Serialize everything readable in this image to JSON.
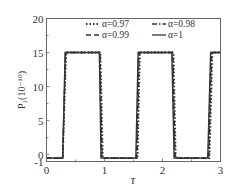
{
  "chart_data": {
    "type": "line",
    "title": "",
    "xlabel": "τ",
    "ylabel": "P₁(10⁻¹⁰)",
    "xlim": [
      0,
      3
    ],
    "ylim": [
      -1,
      20
    ],
    "xticks": [
      0,
      1,
      2,
      3
    ],
    "xtick_labels": [
      "0",
      "1",
      "2",
      "3"
    ],
    "yticks": [
      -1,
      0,
      5,
      10,
      15,
      20
    ],
    "ytick_labels": [
      "-1",
      "0",
      "5",
      "10",
      "15",
      "20"
    ],
    "grid": false,
    "legend_position": "upper center, inside",
    "legend": [
      {
        "label": "α=0.97",
        "style": "dotted"
      },
      {
        "label": "α=0.98",
        "style": "dashdot"
      },
      {
        "label": "α=0.99",
        "style": "dashed"
      },
      {
        "label": "α=1",
        "style": "solid"
      }
    ],
    "series": [
      {
        "name": "α=0.97",
        "style": "dotted",
        "x": [
          0,
          0.28,
          0.34,
          0.93,
          0.97,
          1.57,
          1.61,
          2.19,
          2.23,
          2.81,
          2.86,
          3.0
        ],
        "y": [
          -0.5,
          -0.5,
          15,
          15,
          -0.5,
          -0.5,
          15,
          15,
          -0.5,
          -0.5,
          15,
          15
        ]
      },
      {
        "name": "α=0.98",
        "style": "dashdot",
        "x": [
          0,
          0.28,
          0.33,
          0.92,
          0.96,
          1.56,
          1.6,
          2.18,
          2.22,
          2.8,
          2.85,
          3.0
        ],
        "y": [
          -0.5,
          -0.5,
          15,
          15,
          -0.5,
          -0.5,
          15,
          15,
          -0.5,
          -0.5,
          15,
          15
        ]
      },
      {
        "name": "α=0.99",
        "style": "dashed",
        "x": [
          0,
          0.28,
          0.33,
          0.92,
          0.95,
          1.55,
          1.59,
          2.17,
          2.21,
          2.79,
          2.84,
          3.0
        ],
        "y": [
          -0.5,
          -0.5,
          15,
          15,
          -0.5,
          -0.5,
          15,
          15,
          -0.5,
          -0.5,
          15,
          15
        ]
      },
      {
        "name": "α=1",
        "style": "solid",
        "x": [
          0,
          0.28,
          0.32,
          0.91,
          0.94,
          1.54,
          1.58,
          2.16,
          2.2,
          2.78,
          2.83,
          3.0
        ],
        "y": [
          -0.5,
          -0.5,
          15,
          15,
          -0.5,
          -0.5,
          15,
          15,
          -0.5,
          -0.5,
          15,
          15
        ]
      }
    ]
  },
  "colors": {
    "axis": "#555555",
    "line": "#333333",
    "text": "#333333"
  }
}
